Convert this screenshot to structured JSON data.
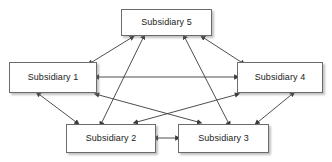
{
  "diagram": {
    "type": "network-graph",
    "title": "",
    "background_color": "#ffffff",
    "node_fill_color": "#ffffff",
    "node_border_color": "#6b6b6b",
    "node_shadow_color": "#9a9a9a",
    "edge_color": "#3a3a3a",
    "label_color": "#1a1a1a",
    "nodes": [
      {
        "id": "s5",
        "label": "Subsidiary 5",
        "x": 121,
        "y": 9,
        "width": 91,
        "height": 27
      },
      {
        "id": "s1",
        "label": "Subsidiary 1",
        "x": 9,
        "y": 62,
        "width": 88,
        "height": 31
      },
      {
        "id": "s4",
        "label": "Subsidiary 4",
        "x": 237,
        "y": 62,
        "width": 86,
        "height": 31
      },
      {
        "id": "s2",
        "label": "Subsidiary 2",
        "x": 66,
        "y": 124,
        "width": 90,
        "height": 29
      },
      {
        "id": "s3",
        "label": "Subsidiary 3",
        "x": 178,
        "y": 124,
        "width": 91,
        "height": 29
      }
    ],
    "edges": [
      {
        "id": "e-s1-s5",
        "from": "s1",
        "to": "s5",
        "direction": "bidirectional",
        "x1": 92,
        "y1": 62,
        "x2": 131,
        "y2": 38
      },
      {
        "id": "e-s4-s5",
        "from": "s4",
        "to": "s5",
        "direction": "bidirectional",
        "x1": 241,
        "y1": 62,
        "x2": 204,
        "y2": 38
      },
      {
        "id": "e-s1-s4",
        "from": "s1",
        "to": "s4",
        "direction": "bidirectional",
        "x1": 99,
        "y1": 77,
        "x2": 235,
        "y2": 77
      },
      {
        "id": "e-s1-s2",
        "from": "s1",
        "to": "s2",
        "direction": "bidirectional",
        "x1": 40,
        "y1": 95,
        "x2": 76,
        "y2": 122
      },
      {
        "id": "e-s4-s3",
        "from": "s4",
        "to": "s3",
        "direction": "bidirectional",
        "x1": 291,
        "y1": 95,
        "x2": 258,
        "y2": 122
      },
      {
        "id": "e-s2-s3",
        "from": "s2",
        "to": "s3",
        "direction": "bidirectional",
        "x1": 158,
        "y1": 138,
        "x2": 176,
        "y2": 138
      },
      {
        "id": "e-s2-s5",
        "from": "s2",
        "to": "s5",
        "direction": "bidirectional",
        "x1": 102,
        "y1": 122,
        "x2": 143,
        "y2": 38
      },
      {
        "id": "e-s3-s5",
        "from": "s3",
        "to": "s5",
        "direction": "bidirectional",
        "x1": 228,
        "y1": 122,
        "x2": 185,
        "y2": 38
      },
      {
        "id": "e-s1-s3",
        "from": "s1",
        "to": "s3",
        "direction": "bidirectional",
        "x1": 99,
        "y1": 95,
        "x2": 198,
        "y2": 122
      },
      {
        "id": "e-s4-s2",
        "from": "s4",
        "to": "s2",
        "direction": "bidirectional",
        "x1": 235,
        "y1": 95,
        "x2": 137,
        "y2": 122
      }
    ]
  }
}
